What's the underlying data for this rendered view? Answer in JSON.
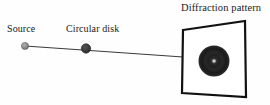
{
  "figure": {
    "title": "Diffraction pattern",
    "background_color": "#fefefe",
    "width": 270,
    "height": 105
  },
  "labels": {
    "source": "Source",
    "circular_disk": "Circular disk",
    "diffraction_pattern": "Diffraction pattern"
  },
  "elements": {
    "source_point": {
      "name": "Source",
      "cx": 25,
      "cy": 46,
      "r": 3.6,
      "fill": "#8a8a8a",
      "stroke": "#5a5a5a"
    },
    "disk_obstacle": {
      "name": "Circular disk",
      "cx": 86,
      "cy": 48.5,
      "r": 4.6,
      "fill": "#3a3a3a",
      "stroke": "#2a2a2a"
    },
    "optical_axis": {
      "name": "light ray",
      "x1": 25,
      "y1": 46,
      "x2": 183,
      "y2": 57,
      "stroke": "#3a3a3a",
      "stroke_width": 1
    },
    "screen": {
      "name": "Screen",
      "corners": [
        [
          183,
          30
        ],
        [
          245,
          21
        ],
        [
          246,
          97
        ],
        [
          182,
          93
        ]
      ],
      "fill": "#ffffff",
      "stroke": "#111111",
      "stroke_width": 2.2
    },
    "pattern_disk": {
      "name": "Diffraction disk with central bright spot",
      "cx": 214,
      "cy": 61,
      "r": 15.5,
      "fill": "#262626",
      "rings": [
        {
          "r": 15.5,
          "color": "#2b2b2b"
        },
        {
          "r": 12.0,
          "color": "#1f1f1f"
        },
        {
          "r": 8.5,
          "color": "#2d2d2d"
        },
        {
          "r": 5.0,
          "color": "#1e1e1e"
        }
      ],
      "center_spot": {
        "name": "Poisson bright spot",
        "size": 3.2,
        "color": "#c9c9c9"
      }
    }
  },
  "colors": {
    "ink": "#1a1a1a",
    "line": "#3a3a3a",
    "screen_border": "#111111",
    "disk_dark": "#262626",
    "bright_spot": "#c9c9c9",
    "source_gray": "#8a8a8a"
  }
}
